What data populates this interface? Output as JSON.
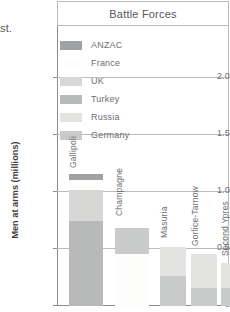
{
  "clipped_text": "st.",
  "header": {
    "title": "Battle Forces"
  },
  "axis": {
    "y_title": "Men at arms (millions)",
    "y_ticks": [
      "0",
      "0.5",
      "1.0",
      "1.5",
      "2.0"
    ]
  },
  "legend": {
    "items": [
      {
        "label": "ANZAC",
        "color": "#a0a2a4"
      },
      {
        "label": "France",
        "color": "#fdfdfb"
      },
      {
        "label": "UK",
        "color": "#d7d8d6"
      },
      {
        "label": "Turkey",
        "color": "#b8bab9"
      },
      {
        "label": "Russia",
        "color": "#e3e4e2"
      },
      {
        "label": "Germany",
        "color": "#c9cbca"
      }
    ]
  },
  "chart_data": {
    "type": "bar",
    "subtype": "stacked",
    "title": "Battle Forces",
    "xlabel": "",
    "ylabel": "Men at arms (millions)",
    "ylim": [
      0,
      2.25
    ],
    "yticks": [
      0,
      0.5,
      1.0,
      1.5,
      2.0
    ],
    "grid": true,
    "legend_position": "top-center-inside",
    "categories": [
      "Gallipoli",
      "Champagne",
      "Masuria",
      "Gorlice-Tarnow",
      "Second Ypres",
      "Neuve Chapelle"
    ],
    "series": [
      {
        "name": "ANZAC",
        "color": "#a0a2a4",
        "values": [
          0.05,
          0,
          0,
          0,
          0,
          0
        ]
      },
      {
        "name": "France",
        "color": "#fdfdfb",
        "values": [
          0.08,
          0.46,
          0,
          0,
          0,
          0
        ]
      },
      {
        "name": "UK",
        "color": "#d7d8d6",
        "values": [
          0.25,
          0,
          0,
          0,
          0,
          0.11
        ]
      },
      {
        "name": "Turkey",
        "color": "#b8bab9",
        "values": [
          0.68,
          0,
          0,
          0,
          0,
          0
        ]
      },
      {
        "name": "Russia",
        "color": "#e3e4e2",
        "values": [
          0,
          0,
          0.26,
          0.3,
          0.22,
          0
        ]
      },
      {
        "name": "Germany",
        "color": "#c9cbca",
        "values": [
          0,
          0.23,
          0.26,
          0.155,
          0.155,
          0.015
        ]
      }
    ],
    "totals": [
      1.06,
      0.69,
      0.52,
      0.455,
      0.375,
      0.125
    ]
  },
  "bars": [
    {
      "label": "Gallipoli",
      "left": 12,
      "width": 34,
      "label_bottom": 138,
      "segments": [
        {
          "name": "Turkey",
          "color": "#b8bab9",
          "height": 85,
          "border": "none"
        },
        {
          "name": "UK",
          "color": "#d7d8d6",
          "height": 31,
          "border": "none"
        },
        {
          "name": "France",
          "color": "#fdfdfb",
          "height": 10,
          "border": "none"
        },
        {
          "name": "ANZAC",
          "color": "#a0a2a4",
          "height": 6,
          "border": "none"
        }
      ]
    },
    {
      "label": "Champagne",
      "left": 58,
      "width": 34,
      "label_bottom": 90,
      "segments": [
        {
          "name": "France",
          "color": "#fdfdfb",
          "height": 52,
          "border": "none"
        },
        {
          "name": "Germany",
          "color": "#c9cbca",
          "height": 26,
          "border": "none"
        }
      ]
    },
    {
      "label": "Masuria",
      "left": 103,
      "width": 26,
      "label_bottom": 68,
      "segments": [
        {
          "name": "Germany",
          "color": "#c9cbca",
          "height": 30,
          "border": "none"
        },
        {
          "name": "Russia",
          "color": "#e3e4e2",
          "height": 29,
          "border": "none"
        }
      ]
    },
    {
      "label": "Gorlice-Tarnow",
      "left": 134,
      "width": 26,
      "label_bottom": 60,
      "segments": [
        {
          "name": "Germany",
          "color": "#c9cbca",
          "height": 18,
          "border": "none"
        },
        {
          "name": "Russia",
          "color": "#e3e4e2",
          "height": 34,
          "border": "none"
        }
      ]
    },
    {
      "label": "Second Ypres",
      "left": 164,
      "width": 26,
      "label_bottom": 50,
      "segments": [
        {
          "name": "Germany",
          "color": "#c9cbca",
          "height": 18,
          "border": "none"
        },
        {
          "name": "Russia",
          "color": "#e3e4e2",
          "height": 25,
          "border": "none"
        }
      ]
    },
    {
      "label": "Neuve Chapelle",
      "left": 195,
      "width": 26,
      "label_bottom": 22,
      "segments": [
        {
          "name": "Germany",
          "color": "#c9cbca",
          "height": 2,
          "border": "none"
        },
        {
          "name": "UK",
          "color": "#e9eae8",
          "height": 12,
          "border": "none"
        }
      ]
    }
  ]
}
